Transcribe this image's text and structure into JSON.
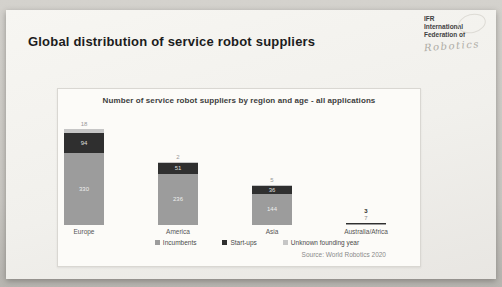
{
  "slide": {
    "title": "Global distribution of service robot suppliers",
    "logo": {
      "line1": "IFR",
      "line2": "International",
      "line3": "Federation of",
      "script": "Robotics"
    }
  },
  "chart_data": {
    "type": "bar",
    "stacked": true,
    "title": "Number of service robot suppliers by region and age - all applications",
    "categories": [
      "Europe",
      "America",
      "Asia",
      "Australia/Africa"
    ],
    "series": [
      {
        "name": "Incumbents",
        "color": "#9c9c9c",
        "values": [
          330,
          236,
          144,
          7
        ]
      },
      {
        "name": "Start-ups",
        "color": "#2f2f2f",
        "values": [
          94,
          51,
          36,
          3
        ]
      },
      {
        "name": "Unknown founding year",
        "color": "#c6c6c6",
        "values": [
          18,
          2,
          5,
          0
        ]
      }
    ],
    "xlabel": "",
    "ylabel": "",
    "grid": false,
    "legend_position": "bottom",
    "source": "Source: World Robotics 2020"
  }
}
